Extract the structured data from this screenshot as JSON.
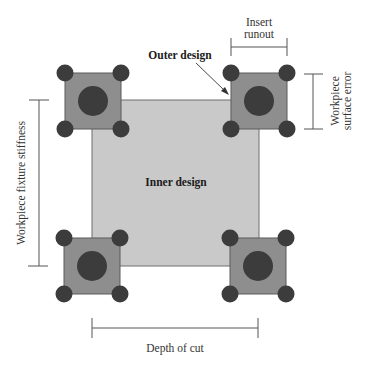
{
  "diagram": {
    "labels": {
      "outer_design": "Outer design",
      "inner_design": "Inner design",
      "insert_runout_line1": "Insert",
      "insert_runout_line2": "runout",
      "surface_error_line1": "Workpiece",
      "surface_error_line2": "surface error",
      "fixture_stiffness": "Workpiece fixture stiffness",
      "depth_of_cut": "Depth of cut"
    },
    "colors": {
      "inner_fill": "#c9c9c9",
      "inner_stroke": "#6e6e6e",
      "insert_fill": "#8e8e8e",
      "insert_stroke": "#5a5a5a",
      "circle_fill": "#3c3c3c",
      "line": "#555555"
    },
    "inserts": [
      {
        "name": "top-left",
        "cx": 93,
        "cy": 101
      },
      {
        "name": "top-right",
        "cx": 259,
        "cy": 101
      },
      {
        "name": "bottom-left",
        "cx": 92,
        "cy": 266
      },
      {
        "name": "bottom-right",
        "cx": 258,
        "cy": 266
      }
    ]
  }
}
